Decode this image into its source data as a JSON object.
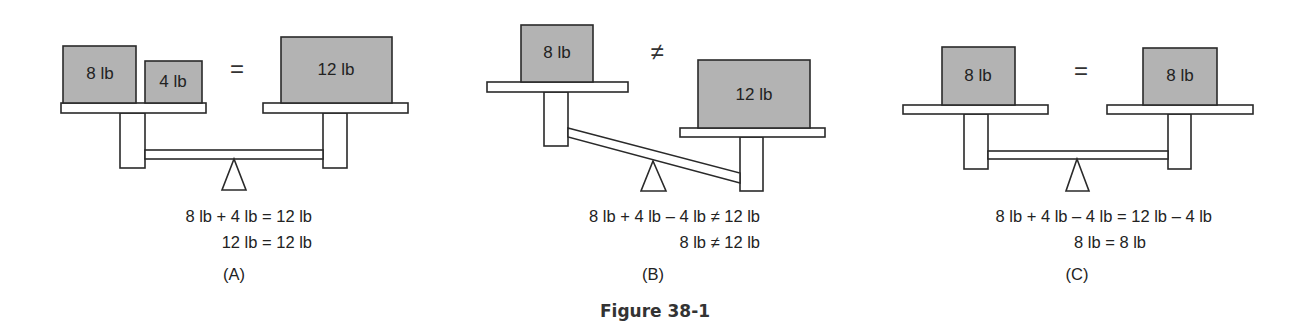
{
  "figure": {
    "caption": "Figure 38-1",
    "panels": [
      {
        "label": "(A)",
        "relation": "=",
        "state": "balanced",
        "left_weights": [
          "8 lb",
          "4 lb"
        ],
        "right_weights": [
          "12 lb"
        ],
        "equations": [
          "8 lb + 4 lb = 12 lb",
          "12 lb = 12 lb"
        ]
      },
      {
        "label": "(B)",
        "relation": "≠",
        "state": "tipped-right-down",
        "left_weights": [
          "8 lb"
        ],
        "right_weights": [
          "12 lb"
        ],
        "equations": [
          "8 lb + 4 lb – 4 lb ≠ 12 lb",
          "8 lb ≠ 12 lb"
        ]
      },
      {
        "label": "(C)",
        "relation": "=",
        "state": "balanced",
        "left_weights": [
          "8 lb"
        ],
        "right_weights": [
          "8 lb"
        ],
        "equations": [
          "8 lb + 4 lb – 4 lb = 12 lb – 4 lb",
          "8 lb = 8 lb"
        ]
      }
    ]
  },
  "colors": {
    "box_fill": "#b3b3b3",
    "outline": "#2a2a2a",
    "background": "#ffffff"
  }
}
